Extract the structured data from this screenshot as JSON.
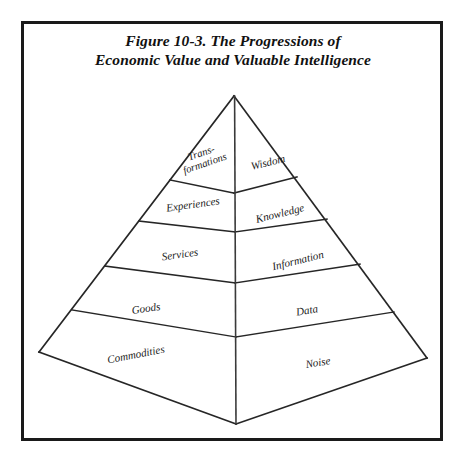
{
  "figure": {
    "caption_line_1": "Figure 10-3. The Progressions of",
    "caption_line_2": "Economic Value and Valuable Intelligence",
    "frame_color": "#1a1a1a",
    "line_color": "#262626",
    "background_color": "#ffffff",
    "text_color": "#1b1b1b"
  },
  "diagram": {
    "type": "layered-pyramid",
    "tier_count": 5,
    "faces": [
      {
        "name": "left-face",
        "progression": "Progression of Economic Value"
      },
      {
        "name": "right-face",
        "progression": "Progression of Valuable Intelligence"
      }
    ],
    "tiers": [
      {
        "level": 5,
        "position": "top",
        "left_label": "Trans-\nformations",
        "left_label_line_1": "Trans-",
        "left_label_line_2": "formations",
        "right_label": "Wisdom"
      },
      {
        "level": 4,
        "position": "upper-middle",
        "left_label": "Experiences",
        "right_label": "Knowledge"
      },
      {
        "level": 3,
        "position": "middle",
        "left_label": "Services",
        "right_label": "Information"
      },
      {
        "level": 2,
        "position": "lower-middle",
        "left_label": "Goods",
        "right_label": "Data"
      },
      {
        "level": 1,
        "position": "base",
        "left_label": "Commodities",
        "right_label": "Noise"
      }
    ]
  }
}
